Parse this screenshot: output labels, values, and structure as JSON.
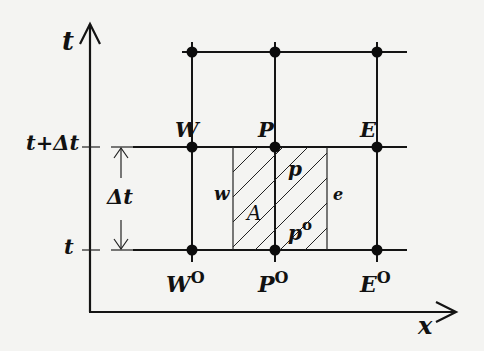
{
  "diagram": {
    "type": "finite-volume space-time control volume",
    "axes": {
      "vertical_label": "t",
      "horizontal_label": "x"
    },
    "time_levels": {
      "upper_label": "t+Δt",
      "lower_label": "t",
      "interval_label": "Δt"
    },
    "nodes_upper": [
      {
        "id": "W",
        "label": "W"
      },
      {
        "id": "P",
        "label": "P"
      },
      {
        "id": "E",
        "label": "E"
      }
    ],
    "nodes_lower": [
      {
        "id": "W0",
        "label": "W",
        "sup": "O"
      },
      {
        "id": "P0",
        "label": "P",
        "sup": "O"
      },
      {
        "id": "E0",
        "label": "E",
        "sup": "O"
      }
    ],
    "control_volume": {
      "west_face_label": "w",
      "east_face_label": "e",
      "area_label": "A",
      "new_value_label": "p",
      "old_value_label": "p",
      "old_value_sup": "o"
    }
  }
}
